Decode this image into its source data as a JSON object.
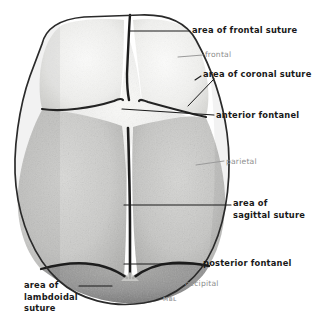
{
  "figure": {
    "signature": "MBL",
    "background_color": "#ffffff",
    "leader_line_color": "#1a1a1a",
    "light_leader_line_color": "#9a9a9a"
  },
  "bones": [
    {
      "name": "frontal",
      "label": "frontal",
      "style": "light",
      "fill": "#f2f2f0",
      "description": "paired frontal bones, upper portion of vault"
    },
    {
      "name": "parietal",
      "label": "parietal",
      "style": "light",
      "fill": "#c9c9c7",
      "description": "paired parietal bones, largest plates of the vault"
    },
    {
      "name": "occipital",
      "label": "occipital",
      "style": "light",
      "fill": "#9a9a98",
      "description": "occipital bone at posterior pole"
    }
  ],
  "sutures": [
    {
      "name": "frontal-suture",
      "label": "area of frontal suture",
      "style": "bold",
      "description": "midline between the two frontal bones"
    },
    {
      "name": "coronal-suture",
      "label": "area of coronal suture",
      "style": "bold",
      "description": "between frontal and parietal bones"
    },
    {
      "name": "sagittal-suture",
      "label": "area of\nsagittal suture",
      "style": "bold",
      "description": "midline between the two parietal bones"
    },
    {
      "name": "lambdoidal-suture",
      "label": "area of\nlambdoidal\nsuture",
      "style": "bold",
      "description": "between parietal and occipital bones"
    }
  ],
  "fontanels": [
    {
      "name": "anterior-fontanel",
      "label": "anterior fontanel",
      "style": "bold",
      "description": "diamond shaped membranous gap at bregma"
    },
    {
      "name": "posterior-fontanel",
      "label": "posterior fontanel",
      "style": "bold",
      "description": "triangular membranous gap at lambda"
    }
  ],
  "labels": {
    "frontal_suture": "area of frontal suture",
    "frontal": "frontal",
    "coronal_suture": "area of coronal suture",
    "anterior_fontanel": "anterior fontanel",
    "parietal": "parietal",
    "sagittal_suture_line1": "area of",
    "sagittal_suture_line2": "sagittal suture",
    "posterior_fontanel": "posterior fontanel",
    "occipital": "occipital",
    "lambdoidal_suture_line1": "area of",
    "lambdoidal_suture_line2": "lambdoidal",
    "lambdoidal_suture_line3": "suture",
    "signature": "MBL"
  }
}
